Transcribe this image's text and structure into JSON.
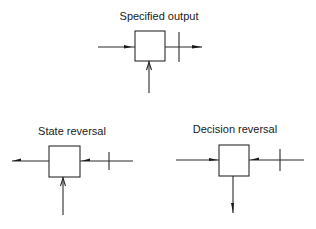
{
  "diagrams": [
    {
      "id": "specified-output",
      "title": "Specified output"
    },
    {
      "id": "state-reversal",
      "title": "State reversal"
    },
    {
      "id": "decision-reversal",
      "title": "Decision reversal"
    }
  ]
}
